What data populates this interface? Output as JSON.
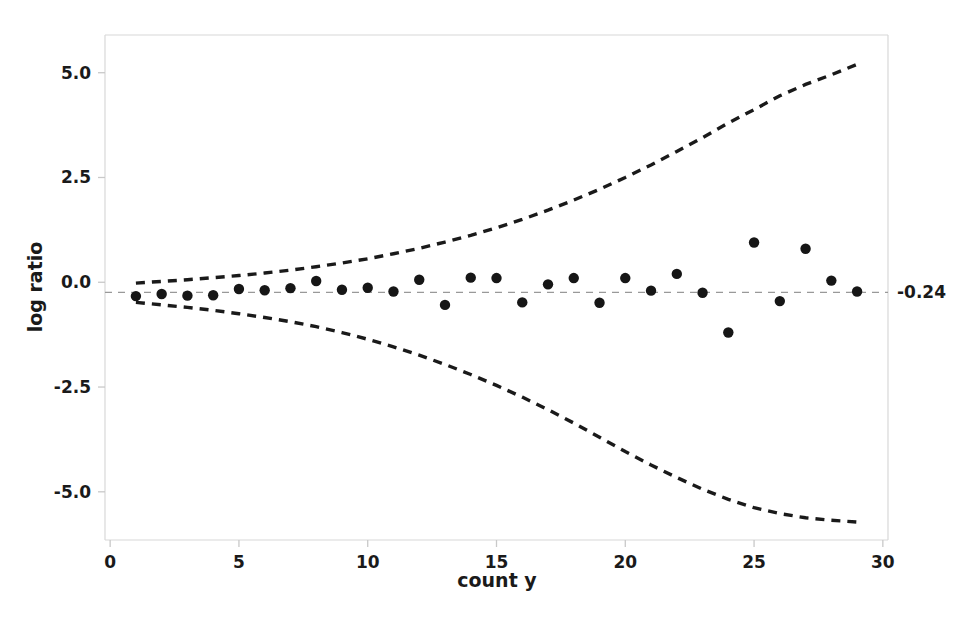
{
  "chart_data": {
    "type": "scatter",
    "title": "",
    "xlabel": "count y",
    "ylabel": "log ratio",
    "xlim": [
      -0.2,
      30.2
    ],
    "ylim": [
      -6.15,
      5.9
    ],
    "xticks": [
      0,
      5,
      10,
      15,
      20,
      25,
      30
    ],
    "xtick_labels": [
      "0",
      "5",
      "10",
      "15",
      "20",
      "25",
      "30"
    ],
    "yticks": [
      5.0,
      2.5,
      0.0,
      -2.5,
      -5.0
    ],
    "ytick_labels": [
      "5.0",
      "2.5",
      "0.0",
      "-2.5",
      "-5.0"
    ],
    "grid": false,
    "legend": null,
    "reference_line": {
      "value": -0.24,
      "label": "-0.24",
      "style": "dashed",
      "color": "#999999"
    },
    "points_style": {
      "marker": "circle",
      "color": "#161616",
      "size": 5.2
    },
    "band_style": {
      "style": "dashed",
      "color": "#1a1a1a",
      "width": 3.4
    },
    "x": [
      1,
      2,
      3,
      4,
      5,
      6,
      7,
      8,
      9,
      10,
      11,
      12,
      13,
      14,
      15,
      16,
      17,
      18,
      19,
      20,
      21,
      22,
      23,
      24,
      25,
      26,
      27,
      28,
      29
    ],
    "y": [
      -0.33,
      -0.28,
      -0.32,
      -0.31,
      -0.16,
      -0.19,
      -0.14,
      0.03,
      -0.18,
      -0.13,
      -0.22,
      0.06,
      -0.54,
      0.11,
      0.1,
      -0.48,
      -0.05,
      0.1,
      -0.49,
      0.1,
      -0.2,
      0.2,
      -0.25,
      -1.2,
      0.95,
      -0.45,
      0.8,
      0.04,
      -0.22
    ],
    "upper_band": {
      "name": "upper 95% limit",
      "x": [
        1,
        2,
        3,
        4,
        5,
        6,
        7,
        8,
        9,
        10,
        11,
        12,
        13,
        14,
        15,
        16,
        17,
        18,
        19,
        20,
        21,
        22,
        23,
        24,
        25,
        26,
        27,
        28,
        29
      ],
      "y": [
        -0.02,
        0.02,
        0.06,
        0.11,
        0.16,
        0.22,
        0.29,
        0.37,
        0.46,
        0.56,
        0.68,
        0.81,
        0.96,
        1.12,
        1.3,
        1.5,
        1.72,
        1.96,
        2.22,
        2.5,
        2.8,
        3.12,
        3.45,
        3.8,
        4.12,
        4.45,
        4.72,
        4.95,
        5.2
      ]
    },
    "lower_band": {
      "name": "lower 95% limit",
      "x": [
        1,
        2,
        3,
        4,
        5,
        6,
        7,
        8,
        9,
        10,
        11,
        12,
        13,
        14,
        15,
        16,
        17,
        18,
        19,
        20,
        21,
        22,
        23,
        24,
        25,
        26,
        27,
        28,
        29
      ],
      "y": [
        -0.48,
        -0.54,
        -0.6,
        -0.67,
        -0.75,
        -0.84,
        -0.94,
        -1.06,
        -1.2,
        -1.36,
        -1.54,
        -1.74,
        -1.96,
        -2.2,
        -2.46,
        -2.74,
        -3.04,
        -3.36,
        -3.7,
        -4.04,
        -4.36,
        -4.66,
        -4.94,
        -5.18,
        -5.38,
        -5.52,
        -5.62,
        -5.68,
        -5.72
      ]
    }
  }
}
